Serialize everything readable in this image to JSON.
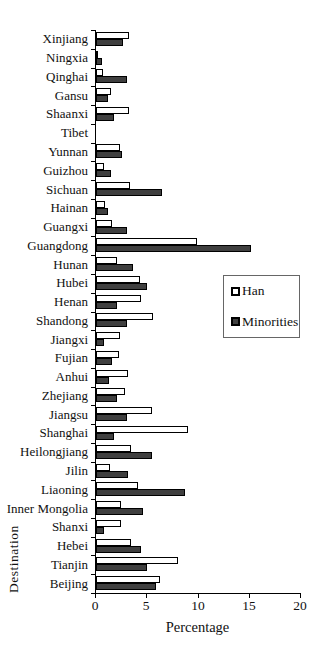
{
  "chart_data": {
    "type": "bar",
    "orientation": "horizontal",
    "title": "",
    "xlabel": "Percentage",
    "ylabel": "Destination",
    "xlim": [
      0,
      20
    ],
    "xticks": [
      0,
      5,
      10,
      15,
      20
    ],
    "grid": false,
    "legend_position": "right-middle",
    "categories": [
      "Xinjiang",
      "Ningxia",
      "Qinghai",
      "Gansu",
      "Shaanxi",
      "Tibet",
      "Yunnan",
      "Guizhou",
      "Sichuan",
      "Hainan",
      "Guangxi",
      "Guangdong",
      "Hunan",
      "Hubei",
      "Henan",
      "Shandong",
      "Jiangxi",
      "Fujian",
      "Anhui",
      "Zhejiang",
      "Jiangsu",
      "Shanghai",
      "Heilongjiang",
      "Jilin",
      "Liaoning",
      "Inner Mongolia",
      "Shanxi",
      "Hebei",
      "Tianjin",
      "Beijing"
    ],
    "series": [
      {
        "name": "Han",
        "color": "#ffffff",
        "values": [
          3.2,
          0.2,
          0.7,
          1.5,
          3.2,
          0,
          2.3,
          0.8,
          3.3,
          0.9,
          1.6,
          9.9,
          2.0,
          4.3,
          4.4,
          5.6,
          2.3,
          2.2,
          3.1,
          2.8,
          5.5,
          9.0,
          3.4,
          1.4,
          4.1,
          2.4,
          2.4,
          3.4,
          8.0,
          6.2
        ]
      },
      {
        "name": "Minorities",
        "color": "#3f3f3f",
        "values": [
          2.6,
          0.6,
          3.0,
          1.2,
          1.8,
          0,
          2.5,
          1.5,
          6.4,
          1.2,
          3.0,
          15.1,
          3.6,
          5.0,
          2.0,
          3.0,
          0.8,
          1.6,
          1.3,
          2.0,
          3.0,
          1.8,
          5.5,
          3.1,
          8.7,
          4.6,
          0.8,
          4.4,
          5.0,
          5.9
        ]
      }
    ],
    "colors": {
      "axis": "#000000",
      "bar_border": "#000000",
      "background": "#ffffff"
    }
  }
}
